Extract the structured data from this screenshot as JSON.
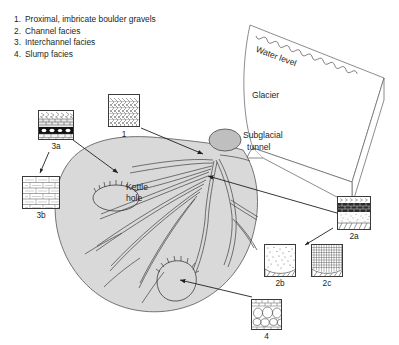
{
  "legend": {
    "items": [
      {
        "num": "1.",
        "text": "Proximal, imbricate boulder gravels"
      },
      {
        "num": "2.",
        "text": "Channel facies"
      },
      {
        "num": "3.",
        "text": "Interchannel facies"
      },
      {
        "num": "4.",
        "text": "Slump facies"
      }
    ]
  },
  "diagram": {
    "glacier_label": "Glacier",
    "water_level_label": "Water level",
    "tunnel_label_line1": "Subglacial",
    "tunnel_label_line2": "tunnel",
    "kettle_label_line1": "Kettle",
    "kettle_label_line2": "hole"
  },
  "facies_boxes": [
    {
      "id": "1",
      "caption": "1",
      "pattern": "imbricate-clasts"
    },
    {
      "id": "3a",
      "caption": "3a",
      "pattern": "gravel-over-black-clast-bed"
    },
    {
      "id": "3b",
      "caption": "3b",
      "pattern": "horizontal-laminae"
    },
    {
      "id": "2a",
      "caption": "2a",
      "pattern": "layered-gravel-sand-hatch"
    },
    {
      "id": "2b",
      "caption": "2b",
      "pattern": "stippled-sand-over-hatch"
    },
    {
      "id": "2c",
      "caption": "2c",
      "pattern": "fine-grid-over-hatch"
    },
    {
      "id": "4",
      "caption": "4",
      "pattern": "oval-clasts"
    }
  ],
  "colors": {
    "ink": "#231f20",
    "fan_fill": "#d9d9d9",
    "tunnel_fill": "#bfbfbf",
    "line": "#3a3a3a"
  }
}
